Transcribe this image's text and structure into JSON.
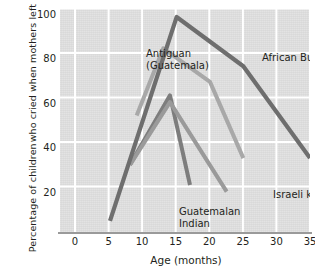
{
  "chart_data": {
    "type": "line",
    "title": "",
    "xlabel": "Age (months)",
    "ylabel": "Percentage of children who cried when mothers left",
    "ylabel_line1": "Percentage of children",
    "ylabel_line2": "who cried when mothers left",
    "xlim": [
      -2.5,
      35
    ],
    "ylim": [
      0,
      100
    ],
    "xticks": [
      0,
      5,
      10,
      15,
      20,
      25,
      30,
      35
    ],
    "yticks": [
      20,
      40,
      60,
      80,
      100
    ],
    "grid": true,
    "legend_position": "inline-annotations",
    "background": "#dddddd",
    "gridline_color": "#ffffff",
    "series": [
      {
        "name": "African Bushman",
        "color": "#6e6e6e",
        "width": 4.2,
        "label_x": 202,
        "label_y": 44,
        "x": [
          5,
          15,
          25,
          35
        ],
        "y": [
          5,
          96,
          74,
          33
        ]
      },
      {
        "name": "Antiguan (Guatemala)",
        "color": "#a8a8a8",
        "width": 4.0,
        "label_line1": "Antiguan",
        "label_line2": "(Guatemala)",
        "label_x": 86,
        "label_y": 40,
        "x": [
          9,
          13,
          20,
          25
        ],
        "y": [
          52,
          82,
          67,
          33
        ]
      },
      {
        "name": "Guatemalan Indian",
        "color": "#7d7d7d",
        "width": 4.0,
        "label_line1": "Guatemalan",
        "label_line2": "Indian",
        "label_x": 119,
        "label_y": 198,
        "x": [
          8,
          14,
          17
        ],
        "y": [
          30,
          61,
          21
        ]
      },
      {
        "name": "Israeli kibbutzim",
        "color": "#9a9a9a",
        "width": 4.0,
        "label_x": 213,
        "label_y": 181,
        "x": [
          8,
          14,
          22.5
        ],
        "y": [
          30,
          58,
          18
        ]
      }
    ]
  },
  "axis": {
    "x_tick_labels": [
      "0",
      "5",
      "10",
      "15",
      "20",
      "25",
      "30",
      "35"
    ],
    "y_tick_labels": [
      "20",
      "40",
      "60",
      "80",
      "100"
    ],
    "x_title": "Age (months)",
    "y_title_line1": "Percentage of children",
    "y_title_line2": "who cried when mothers left"
  },
  "annotations": {
    "antiguan_line1": "Antiguan",
    "antiguan_line2": "(Guatemala)",
    "african_bushman": "African Bushman",
    "israeli_kibbutzim": "Israeli kibbutzim",
    "guatemalan_line1": "Guatemalan",
    "guatemalan_line2": "Indian"
  }
}
